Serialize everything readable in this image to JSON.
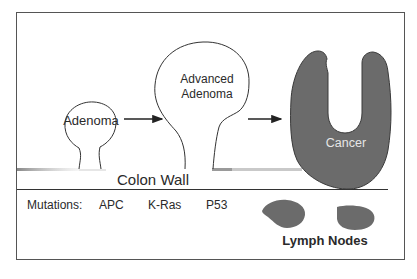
{
  "diagram": {
    "stages": [
      {
        "id": "adenoma",
        "label": "Adenoma"
      },
      {
        "id": "advanced-adenoma",
        "label_line1": "Advanced",
        "label_line2": "Adenoma"
      },
      {
        "id": "cancer",
        "label": "Cancer"
      }
    ],
    "wall_label": "Colon Wall",
    "mutations": {
      "label": "Mutations:",
      "genes": [
        "APC",
        "K-Ras",
        "P53"
      ]
    },
    "lymph_nodes_label": "Lymph Nodes",
    "colors": {
      "frame": "#555555",
      "outline": "#333333",
      "cancer_fill": "#6b6b6b",
      "cancer_text": "#e6e6e6",
      "text": "#2a2a2a",
      "wall_shade": "#9a9a9a"
    }
  }
}
